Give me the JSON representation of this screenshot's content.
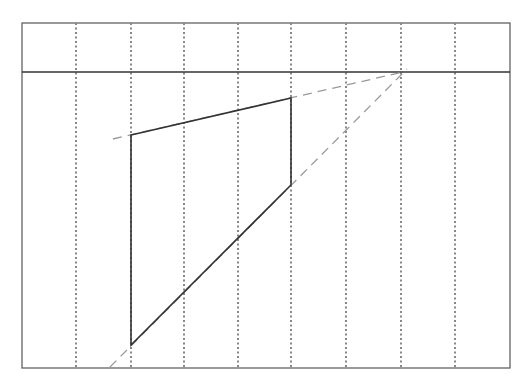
{
  "diagram": {
    "title": "",
    "canvas": {
      "width": 527,
      "height": 389
    },
    "frame": {
      "x1": 22,
      "y1": 23,
      "x2": 510,
      "y2": 368,
      "stroke": "#555555"
    },
    "horizon_line": {
      "y": 72,
      "x1": 22,
      "x2": 510,
      "stroke": "#333333"
    },
    "vertical_guides_x": [
      76,
      131,
      184,
      238,
      291,
      346,
      401,
      455
    ],
    "guide_color": "#888888",
    "vanishing_point": {
      "x": 403,
      "y": 72
    },
    "shape": {
      "stroke": "#333333",
      "corners": {
        "top_left": {
          "x": 131,
          "y": 135
        },
        "top_right": {
          "x": 291,
          "y": 98
        },
        "bottom_right": {
          "x": 291,
          "y": 185
        },
        "bottom_left": {
          "x": 131,
          "y": 345
        }
      }
    },
    "construction_lines": {
      "stroke": "#999999",
      "upper": {
        "x1": 113,
        "y1": 139,
        "x2": 403,
        "y2": 72
      },
      "lower": {
        "x1": 110,
        "y1": 367,
        "x2": 407,
        "y2": 69
      }
    }
  }
}
